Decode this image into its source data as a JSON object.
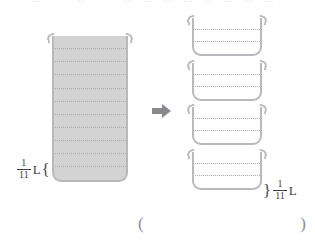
{
  "top_strip": {
    "ghost_text": "—  □  —  □  —  □  □  □  □  □  □  □  □"
  },
  "diagram": {
    "left_container": {
      "name": "whole-container",
      "segments": 11,
      "fill_color": "#d3d3d3",
      "outline_color": "#b9b9bd",
      "filled": true
    },
    "right_containers": [
      {
        "name": "portion-container-1",
        "segments": 3,
        "filled": false
      },
      {
        "name": "portion-container-2",
        "segments": 3,
        "filled": false
      },
      {
        "name": "portion-container-3",
        "segments": 3,
        "filled": false
      },
      {
        "name": "portion-container-4",
        "segments": 3,
        "filled": false
      }
    ],
    "arrow": {
      "icon": "arrow-right-icon",
      "direction": "right",
      "color": "#8a8a8e"
    }
  },
  "labels": {
    "left": {
      "numerator": "1",
      "denominator": "11",
      "unit": "L",
      "brace": "{"
    },
    "right": {
      "brace": "}",
      "numerator": "1",
      "denominator": "11",
      "unit": "L"
    }
  },
  "answer_blank": {
    "open_paren": "(",
    "close_paren": ")"
  }
}
